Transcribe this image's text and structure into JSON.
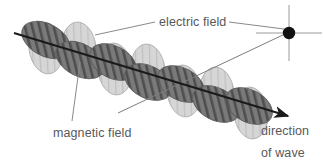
{
  "diagram": {
    "background_color": "#ffffff",
    "labels": {
      "electric_field": "electric field",
      "magnetic_field": "magnetic field",
      "direction": "direction",
      "of_wave": "of wave"
    },
    "colors": {
      "electric_lobe_fill": "#7a7a7a",
      "electric_lobe_stripe": "#4f4f4f",
      "magnetic_lobe_fill": "#d5d5d5",
      "magnetic_lobe_stripe": "#c2c2c2",
      "lobe_outline": "#6f6f6f",
      "axis_line": "#1a1a1a",
      "leader_line": "#8a8a8a",
      "crosshair": "#9a9a9a",
      "dot": "#111111",
      "text": "#58585a"
    },
    "axis": {
      "label": "propagation-axis",
      "start": [
        14,
        33
      ],
      "end": [
        292,
        117
      ],
      "has_arrowhead": true
    },
    "ray_line": {
      "label": "electric-field-plane-ray",
      "start": [
        118,
        113
      ],
      "end": [
        287,
        33
      ]
    },
    "crosshair": {
      "center": [
        289,
        33
      ],
      "half_width": 33,
      "half_height": 28,
      "dot_radius": 6
    },
    "leaders": {
      "electric_field": {
        "from": [
          155,
          22
        ],
        "to": [
          95,
          35
        ]
      },
      "magnetic_field": {
        "from": [
          72,
          121
        ],
        "to": [
          80,
          62
        ]
      }
    },
    "lobes": [
      {
        "type": "electric",
        "cx": 46,
        "cy": 40,
        "rx": 16,
        "ry": 26,
        "rot": -62
      },
      {
        "type": "magnetic",
        "cx": 46,
        "cy": 48,
        "rx": 17,
        "ry": 26,
        "rot": -8
      },
      {
        "type": "magnetic",
        "cx": 79,
        "cy": 48,
        "rx": 17,
        "ry": 26,
        "rot": -6
      },
      {
        "type": "electric",
        "cx": 80,
        "cy": 60,
        "rx": 16,
        "ry": 26,
        "rot": -62
      },
      {
        "type": "electric",
        "cx": 113,
        "cy": 62,
        "rx": 16,
        "ry": 25,
        "rot": -62
      },
      {
        "type": "magnetic",
        "cx": 115,
        "cy": 69,
        "rx": 17,
        "ry": 26,
        "rot": -6
      },
      {
        "type": "magnetic",
        "cx": 148,
        "cy": 70,
        "rx": 17,
        "ry": 26,
        "rot": -6
      },
      {
        "type": "electric",
        "cx": 148,
        "cy": 82,
        "rx": 16,
        "ry": 25,
        "rot": -62
      },
      {
        "type": "electric",
        "cx": 181,
        "cy": 84,
        "rx": 16,
        "ry": 25,
        "rot": -62
      },
      {
        "type": "magnetic",
        "cx": 184,
        "cy": 91,
        "rx": 17,
        "ry": 26,
        "rot": -6
      },
      {
        "type": "magnetic",
        "cx": 217,
        "cy": 93,
        "rx": 17,
        "ry": 26,
        "rot": -6
      },
      {
        "type": "electric",
        "cx": 216,
        "cy": 104,
        "rx": 16,
        "ry": 25,
        "rot": -62
      },
      {
        "type": "electric",
        "cx": 249,
        "cy": 106,
        "rx": 16,
        "ry": 25,
        "rot": -62
      },
      {
        "type": "magnetic",
        "cx": 251,
        "cy": 113,
        "rx": 17,
        "ry": 26,
        "rot": -6
      }
    ]
  }
}
